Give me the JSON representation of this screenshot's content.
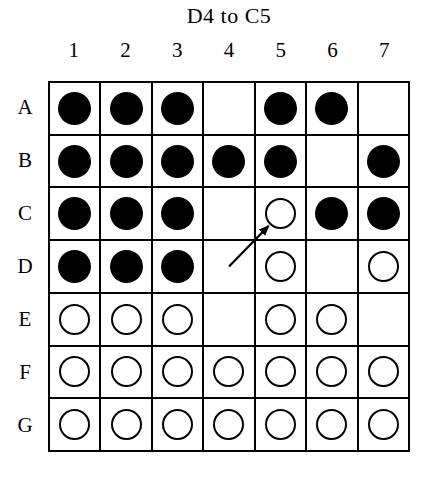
{
  "title": "D4 to C5",
  "board": {
    "column_labels": [
      "1",
      "2",
      "3",
      "4",
      "5",
      "6",
      "7"
    ],
    "row_labels": [
      "A",
      "B",
      "C",
      "D",
      "E",
      "F",
      "G"
    ],
    "cells": [
      [
        "filled",
        "filled",
        "filled",
        "empty",
        "filled",
        "filled",
        "empty"
      ],
      [
        "filled",
        "filled",
        "filled",
        "filled",
        "filled",
        "empty",
        "filled"
      ],
      [
        "filled",
        "filled",
        "filled",
        "empty",
        "open",
        "filled",
        "filled"
      ],
      [
        "filled",
        "filled",
        "filled",
        "empty",
        "open",
        "empty",
        "open"
      ],
      [
        "open",
        "open",
        "open",
        "empty",
        "open",
        "open",
        "empty"
      ],
      [
        "open",
        "open",
        "open",
        "open",
        "open",
        "open",
        "open"
      ],
      [
        "open",
        "open",
        "open",
        "open",
        "open",
        "open",
        "open"
      ]
    ],
    "arrow": {
      "from": "D4",
      "to": "C5"
    }
  },
  "colors": {
    "ink": "#000000",
    "background": "#ffffff"
  }
}
